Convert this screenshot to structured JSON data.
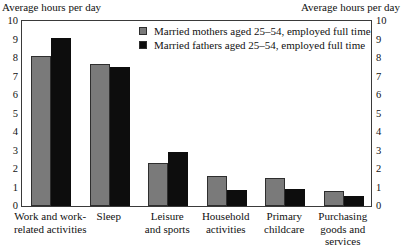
{
  "axis_titles": {
    "left": "Average hours per day",
    "right": "Average hours per day"
  },
  "legend": {
    "series_a_label": "Married mothers aged 25–54, employed full time",
    "series_b_label": "Married fathers aged 25–54, employed full time",
    "series_a_color": "#7a7a7a",
    "series_b_color": "#0d0d0d"
  },
  "ticks": [
    "10",
    "9",
    "8",
    "7",
    "6",
    "5",
    "4",
    "3",
    "2",
    "1",
    "0"
  ],
  "categories": [
    "Work and work-\nrelated activities",
    "Sleep",
    "Leisure\nand sports",
    "Household\nactivities",
    "Primary\nchildcare",
    "Purchasing\ngoods and\nservices"
  ],
  "chart_data": {
    "type": "bar",
    "title": "",
    "xlabel": "",
    "ylabel": "Average hours per day",
    "ylim": [
      0,
      10
    ],
    "yticks": [
      0,
      1,
      2,
      3,
      4,
      5,
      6,
      7,
      8,
      9,
      10
    ],
    "grid": false,
    "legend_position": "top-center",
    "dual_axis": true,
    "categories": [
      "Work and work-related activities",
      "Sleep",
      "Leisure and sports",
      "Household activities",
      "Primary childcare",
      "Purchasing goods and services"
    ],
    "series": [
      {
        "name": "Married mothers aged 25–54, employed full time",
        "color": "#7a7a7a",
        "values": [
          8.1,
          7.7,
          2.3,
          1.6,
          1.5,
          0.8
        ]
      },
      {
        "name": "Married fathers aged 25–54, employed full time",
        "color": "#0d0d0d",
        "values": [
          9.1,
          7.5,
          2.9,
          0.85,
          0.9,
          0.55
        ]
      }
    ]
  }
}
